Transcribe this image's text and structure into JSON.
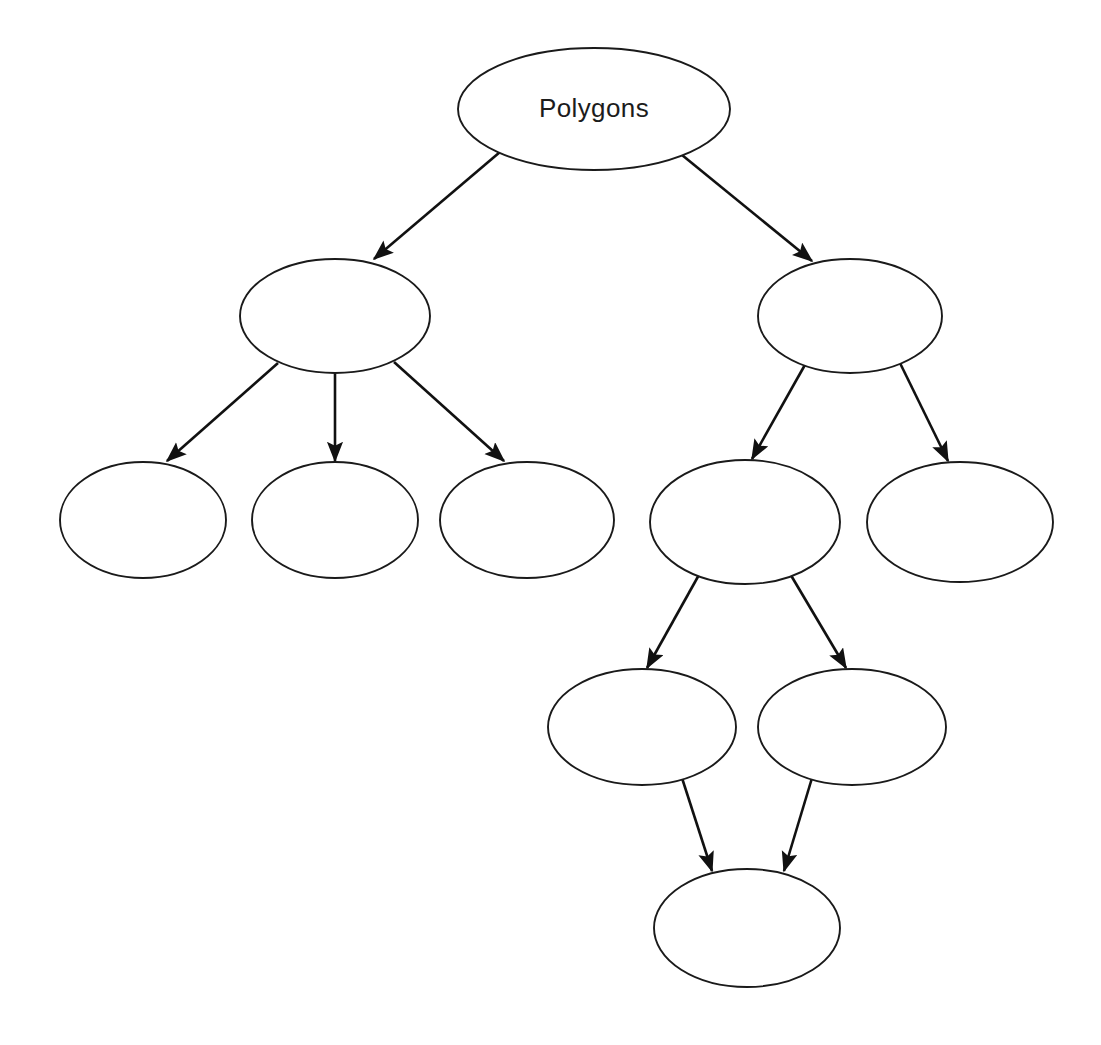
{
  "diagram": {
    "title": "Polygons",
    "type": "hierarchy-concept-map",
    "background_color": "#ffffff",
    "stroke_color": "#1a1a1a",
    "edge_color": "#111111",
    "node_fill": "#ffffff",
    "label_color": "#1c1c1c",
    "nodes": [
      {
        "id": "root",
        "label": "Polygons",
        "cx": 594,
        "cy": 109,
        "rx": 136,
        "ry": 61,
        "level": 1
      },
      {
        "id": "l2a",
        "label": "",
        "cx": 335,
        "cy": 316,
        "rx": 95,
        "ry": 57,
        "level": 2
      },
      {
        "id": "l2b",
        "label": "",
        "cx": 850,
        "cy": 316,
        "rx": 92,
        "ry": 57,
        "level": 2
      },
      {
        "id": "l3a",
        "label": "",
        "cx": 143,
        "cy": 520,
        "rx": 83,
        "ry": 58,
        "level": 3
      },
      {
        "id": "l3b",
        "label": "",
        "cx": 335,
        "cy": 520,
        "rx": 83,
        "ry": 58,
        "level": 3
      },
      {
        "id": "l3c",
        "label": "",
        "cx": 527,
        "cy": 520,
        "rx": 87,
        "ry": 58,
        "level": 3
      },
      {
        "id": "l3d",
        "label": "",
        "cx": 745,
        "cy": 522,
        "rx": 95,
        "ry": 62,
        "level": 3
      },
      {
        "id": "l3e",
        "label": "",
        "cx": 960,
        "cy": 522,
        "rx": 93,
        "ry": 60,
        "level": 3
      },
      {
        "id": "l4a",
        "label": "",
        "cx": 642,
        "cy": 727,
        "rx": 94,
        "ry": 58,
        "level": 4
      },
      {
        "id": "l4b",
        "label": "",
        "cx": 852,
        "cy": 727,
        "rx": 94,
        "ry": 58,
        "level": 4
      },
      {
        "id": "l5a",
        "label": "",
        "cx": 747,
        "cy": 928,
        "rx": 93,
        "ry": 59,
        "level": 5
      }
    ],
    "edges": [
      {
        "id": "e1",
        "from": "root",
        "to": "l2a",
        "x1": 500,
        "y1": 152,
        "x2": 374,
        "y2": 259
      },
      {
        "id": "e2",
        "from": "root",
        "to": "l2b",
        "x1": 682,
        "y1": 155,
        "x2": 812,
        "y2": 261
      },
      {
        "id": "e3",
        "from": "l2a",
        "to": "l3a",
        "x1": 278,
        "y1": 363,
        "x2": 167,
        "y2": 461
      },
      {
        "id": "e4",
        "from": "l2a",
        "to": "l3b",
        "x1": 335,
        "y1": 374,
        "x2": 335,
        "y2": 461
      },
      {
        "id": "e5",
        "from": "l2a",
        "to": "l3c",
        "x1": 394,
        "y1": 362,
        "x2": 504,
        "y2": 461
      },
      {
        "id": "e6",
        "from": "l2b",
        "to": "l3d",
        "x1": 806,
        "y1": 363,
        "x2": 752,
        "y2": 459
      },
      {
        "id": "e7",
        "from": "l2b",
        "to": "l3e",
        "x1": 899,
        "y1": 361,
        "x2": 948,
        "y2": 461
      },
      {
        "id": "e8",
        "from": "l3d",
        "to": "l4a",
        "x1": 700,
        "y1": 573,
        "x2": 647,
        "y2": 668
      },
      {
        "id": "e9",
        "from": "l3d",
        "to": "l4b",
        "x1": 789,
        "y1": 572,
        "x2": 846,
        "y2": 668
      },
      {
        "id": "e10",
        "from": "l4a",
        "to": "l5a",
        "x1": 682,
        "y1": 778,
        "x2": 712,
        "y2": 871
      },
      {
        "id": "e11",
        "from": "l4b",
        "to": "l5a",
        "x1": 812,
        "y1": 778,
        "x2": 784,
        "y2": 871
      }
    ]
  }
}
